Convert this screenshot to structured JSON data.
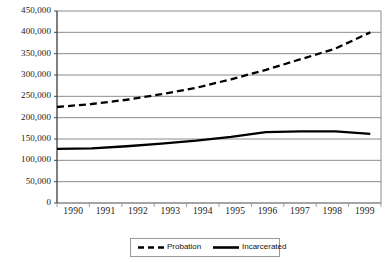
{
  "chart_data": {
    "type": "line",
    "title": "",
    "xlabel": "",
    "ylabel": "",
    "grid": true,
    "legend_position": "bottom",
    "ylim": [
      0,
      450000
    ],
    "ytick_step": 50000,
    "categories": [
      "1990",
      "1991",
      "1992",
      "1993",
      "1994",
      "1995",
      "1996",
      "1997",
      "1998",
      "1999"
    ],
    "ytick_labels": [
      "450,000",
      "400,000",
      "350,000",
      "300,000",
      "250,000",
      "200,000",
      "150,000",
      "100,000",
      "50,000",
      "0"
    ],
    "ytick_values": [
      450000,
      400000,
      350000,
      300000,
      250000,
      200000,
      150000,
      100000,
      50000,
      0
    ],
    "series": [
      {
        "name": "Probation",
        "style": "dashed",
        "color": "#000000",
        "values": [
          225000,
          232000,
          242000,
          255000,
          270000,
          290000,
          312000,
          337000,
          362000,
          400000
        ]
      },
      {
        "name": "Incarcerated",
        "style": "solid",
        "color": "#000000",
        "values": [
          127000,
          128000,
          133000,
          139000,
          146000,
          155000,
          166000,
          168000,
          168000,
          162000
        ]
      }
    ]
  },
  "axis": {
    "ticks": [
      {
        "label": "450,000"
      },
      {
        "label": "400,000"
      },
      {
        "label": "350,000"
      },
      {
        "label": "300,000"
      },
      {
        "label": "250,000"
      },
      {
        "label": "200,000"
      },
      {
        "label": "150,000"
      },
      {
        "label": "100,000"
      },
      {
        "label": "50,000"
      },
      {
        "label": "0"
      }
    ],
    "years": [
      {
        "label": "1990"
      },
      {
        "label": "1991"
      },
      {
        "label": "1992"
      },
      {
        "label": "1993"
      },
      {
        "label": "1994"
      },
      {
        "label": "1995"
      },
      {
        "label": "1996"
      },
      {
        "label": "1997"
      },
      {
        "label": "1998"
      },
      {
        "label": "1999"
      }
    ]
  },
  "legend": {
    "entries": [
      {
        "label": "Probation",
        "style": "dashed"
      },
      {
        "label": "Incarcerated",
        "style": "solid"
      }
    ]
  },
  "colors": {
    "gridline": "#808080",
    "axis": "#555555",
    "series": "#000000",
    "background": "#ffffff",
    "legend_border": "#9a9a9a"
  }
}
